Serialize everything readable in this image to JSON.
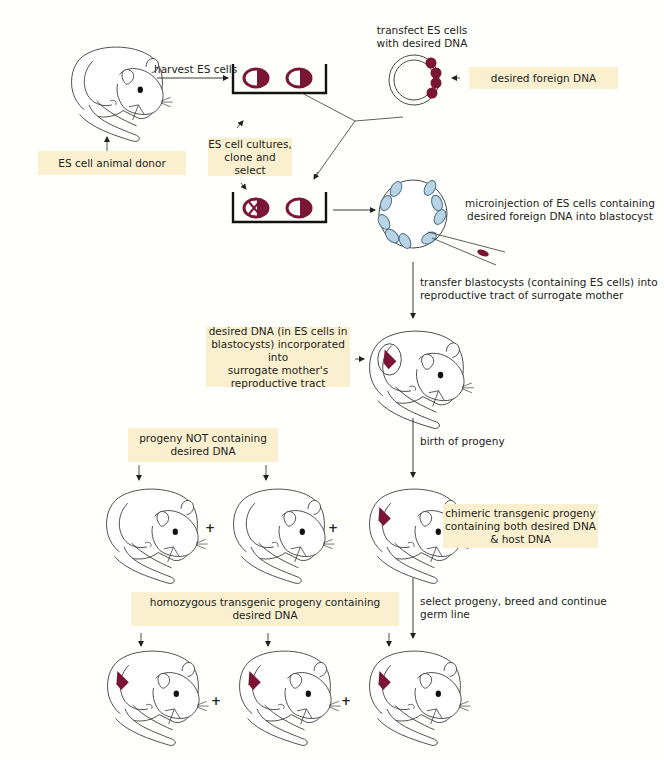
{
  "colors": {
    "background": "#fffffb",
    "label_box": "#faf0cf",
    "dna_marker": "#7a1535",
    "es_cell_fill": "#b8d4e4",
    "es_cell_stroke": "#4a6f88",
    "line": "#333333"
  },
  "labels": {
    "harvest": "harvest ES cells",
    "transfect_line1": "transfect ES cells",
    "transfect_line2": "with desired DNA",
    "desired_foreign_dna": "desired foreign DNA",
    "es_donor": "ES cell animal donor",
    "cultures_line1": "ES cell cultures,",
    "cultures_line2": "clone and select",
    "microinjection_line1": "microinjection of ES cells containing",
    "microinjection_line2": "desired foreign DNA into blastocyst",
    "transfer_line1": "transfer blastocysts (containing ES cells) into",
    "transfer_line2": "reproductive tract of surrogate mother",
    "incorporated_line1": "desired DNA (in ES cells in",
    "incorporated_line2": "blastocysts) incorporated into",
    "incorporated_line3": "surrogate mother's",
    "incorporated_line4": "reproductive tract",
    "birth": "birth of progeny",
    "not_containing_line1": "progeny NOT containing",
    "not_containing_line2": "desired DNA",
    "chimeric_line1": "chimeric transgenic progeny",
    "chimeric_line2": "containing both desired DNA",
    "chimeric_line3": "& host DNA",
    "homozygous_line1": "homozygous transgenic progeny containing",
    "homozygous_line2": "desired DNA",
    "select_line1": "select progeny, breed and continue",
    "select_line2": "germ line",
    "plus": "+"
  }
}
